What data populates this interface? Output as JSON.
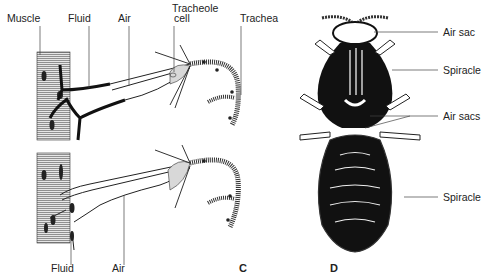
{
  "figure": {
    "panels": [
      {
        "id": "C",
        "letter": "C",
        "subtitle": "Tracheole endings in muscle (fluid vs air states)",
        "top_labels": [
          "Muscle",
          "Fluid",
          "Air",
          "Tracheole cell",
          "Trachea"
        ],
        "bottom_labels": [
          "Fluid",
          "Air"
        ]
      },
      {
        "id": "D",
        "letter": "D",
        "subtitle": "Insect body with air sacs and spiracles",
        "labels": [
          "Air sac",
          "Spiracle",
          "Air sacs",
          "Spiracle"
        ]
      }
    ]
  },
  "labels": {
    "muscle": "Muscle",
    "fluid_top": "Fluid",
    "air_top": "Air",
    "tracheole_cell_1": "Tracheole",
    "tracheole_cell_2": "cell",
    "trachea": "Trachea",
    "fluid_bottom": "Fluid",
    "air_bottom": "Air",
    "panel_c": "C",
    "panel_d": "D",
    "air_sac": "Air sac",
    "spiracle_1": "Spiracle",
    "air_sacs": "Air sacs",
    "spiracle_2": "Spiracle"
  },
  "colors": {
    "ink": "#1a1a1a",
    "muscle_fill": "#cfcfcf",
    "background": "#ffffff"
  }
}
